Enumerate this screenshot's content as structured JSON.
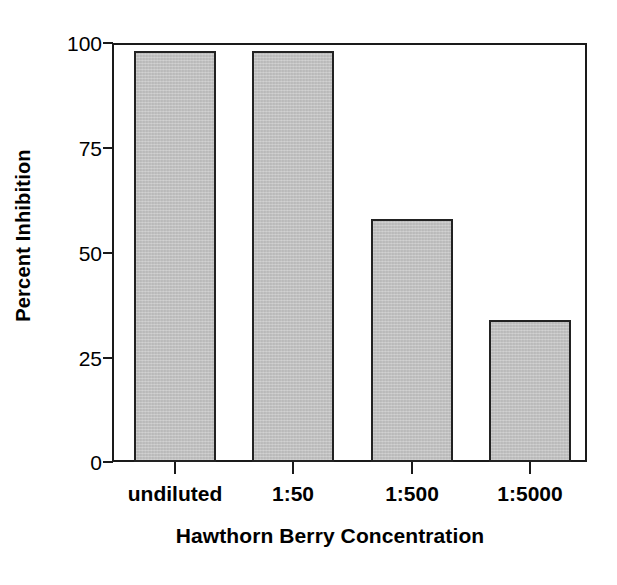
{
  "chart_data": {
    "type": "bar",
    "title": "",
    "subtitle": "",
    "xlabel": "Hawthorn Berry Concentration",
    "ylabel": "Percent Inhibition",
    "categories": [
      "undiluted",
      "1:50",
      "1:500",
      "1:5000"
    ],
    "values": [
      98,
      98,
      58,
      34
    ],
    "series": [
      {
        "name": "Percent Inhibition",
        "values": [
          98,
          98,
          58,
          34
        ]
      }
    ],
    "ylim": [
      0,
      100
    ],
    "yticks": [
      0,
      25,
      50,
      75,
      100
    ],
    "ytick_labels": [
      "0",
      "25",
      "50",
      "75",
      "100"
    ],
    "xtick_labels": [
      "undiluted",
      "1:50",
      "1:500",
      "1:5000"
    ],
    "grid": false,
    "legend": false,
    "legend_position": "none",
    "bar_fill_color": "#c4c4c4",
    "bar_edge_color": "#222222",
    "axis_color": "#1a1a1a",
    "background_color": "#ffffff"
  },
  "axes": {
    "y_title": "Percent Inhibition",
    "x_title": "Hawthorn Berry Concentration"
  }
}
